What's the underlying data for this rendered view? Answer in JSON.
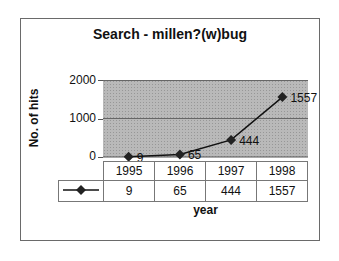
{
  "chart_data": {
    "type": "line",
    "title": "Search - millen?(w)bug",
    "xlabel": "year",
    "ylabel": "No. of hits",
    "categories": [
      "1995",
      "1996",
      "1997",
      "1998"
    ],
    "series": [
      {
        "name": "",
        "marker": "diamond",
        "values": [
          9,
          65,
          444,
          1557
        ]
      }
    ],
    "data_labels": [
      "9",
      "65",
      "444",
      "1557"
    ],
    "yticks": [
      "0",
      "1000",
      "2000"
    ],
    "ylim": [
      0,
      2000
    ],
    "grid": true,
    "plot_background": "#b9b9b9",
    "legend_position": "data-table",
    "data_table": {
      "header": [
        "1995",
        "1996",
        "1997",
        "1998"
      ],
      "row": [
        "9",
        "65",
        "444",
        "1557"
      ]
    }
  }
}
